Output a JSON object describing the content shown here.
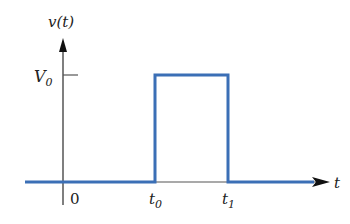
{
  "diagram": {
    "y_axis_label": "v(t)",
    "y_axis_label_parts": {
      "base": "v",
      "arg": "(t)"
    },
    "x_axis_label": "t",
    "level_label": {
      "base": "V",
      "sub": "0"
    },
    "origin_label": "0",
    "t0_label": {
      "base": "t",
      "sub": "0"
    },
    "t1_label": {
      "base": "t",
      "sub": "1"
    },
    "colors": {
      "signal": "#3b6fb6",
      "axis": "#555555",
      "arrow": "#111111"
    }
  }
}
